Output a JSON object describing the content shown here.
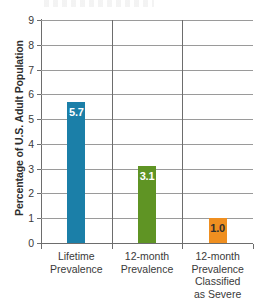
{
  "chart_data": {
    "type": "bar",
    "title": "",
    "xlabel": "",
    "ylabel": "Percentage of U.S. Adult Population",
    "ylim": [
      0,
      9
    ],
    "yticks": [
      "0",
      "1",
      "2",
      "3",
      "4",
      "5",
      "6",
      "7",
      "8",
      "9"
    ],
    "grid": true,
    "legend": "none",
    "categories": [
      "Lifetime\nPrevalence",
      "12-month\nPrevalence",
      "12-month\nPrevalence\nClassified\nas Severe"
    ],
    "category_lines": [
      [
        "Lifetime",
        "Prevalence"
      ],
      [
        "12-month",
        "Prevalence"
      ],
      [
        "12-month",
        "Prevalence",
        "Classified",
        "as Severe"
      ]
    ],
    "values": [
      5.7,
      3.1,
      1.0
    ],
    "value_labels": [
      "5.7",
      "3.1",
      "1.0"
    ],
    "bar_colors": [
      "#1b7fa8",
      "#5f9424",
      "#ef8f20"
    ],
    "value_label_colors": [
      "#ffffff",
      "#ffffff",
      "#2e2e2e"
    ]
  },
  "axis": {
    "y_title": "Percentage of U.S. Adult Population",
    "ticks": [
      "9",
      "8",
      "7",
      "6",
      "5",
      "4",
      "3",
      "2",
      "1",
      "0"
    ]
  }
}
